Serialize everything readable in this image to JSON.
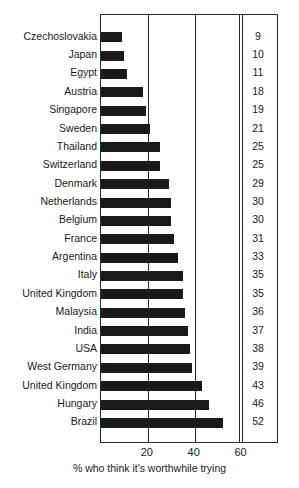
{
  "chart_data": {
    "type": "bar",
    "orientation": "horizontal",
    "title": "",
    "subtitle": "",
    "xlabel": "% who think it's worthwhile trying",
    "ylabel": "",
    "xlim": [
      0,
      76
    ],
    "xticks": [
      20,
      40,
      60
    ],
    "xtick_labels": [
      "20",
      "40",
      "60"
    ],
    "grid": "vertical-at-xticks",
    "legend": null,
    "value_column_header": "",
    "bar_color": "#1a1a1a",
    "frame_color": "#2b2b2b",
    "background": "#ffffff",
    "categories": [
      "Czechoslovakia",
      "Japan",
      "Egypt",
      "Austria",
      "Singapore",
      "Sweden",
      "Thailand",
      "Switzerland",
      "Denmark",
      "Netherlands",
      "Belgium",
      "France",
      "Argentina",
      "Italy",
      "United Kingdom",
      "Malaysia",
      "India",
      "USA",
      "West Germany",
      "United Kingdom",
      "Hungary",
      "Brazil"
    ],
    "values": [
      9,
      10,
      11,
      18,
      19,
      21,
      25,
      25,
      29,
      30,
      30,
      31,
      33,
      35,
      35,
      36,
      37,
      38,
      39,
      43,
      46,
      52
    ],
    "value_labels": [
      "9",
      "10",
      "11",
      "18",
      "19",
      "21",
      "25",
      "25",
      "29",
      "30",
      "30",
      "31",
      "33",
      "35",
      "35",
      "36",
      "37",
      "38",
      "39",
      "43",
      "46",
      "52"
    ]
  }
}
